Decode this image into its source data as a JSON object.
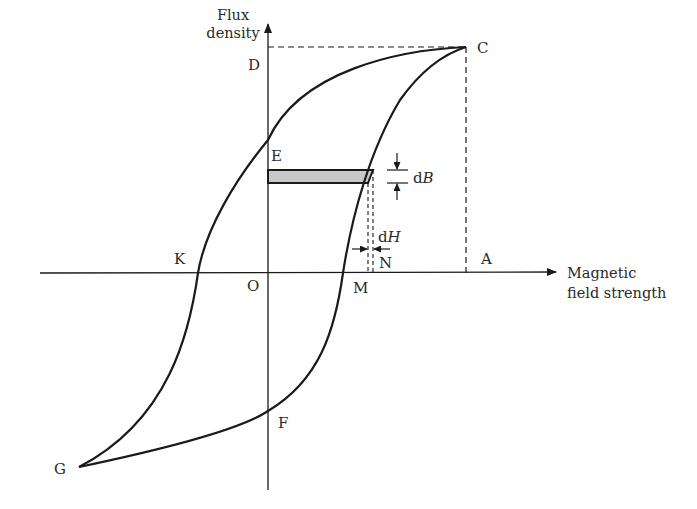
{
  "diagram": {
    "y_axis_title": [
      "Flux",
      "density"
    ],
    "x_axis_title": [
      "Magnetic",
      "field strength"
    ],
    "points": {
      "D": "D",
      "C": "C",
      "E": "E",
      "K": "K",
      "O": "O",
      "M": "M",
      "N": "N",
      "A": "A",
      "F": "F",
      "G": "G"
    },
    "increments": {
      "dB_prefix": "d",
      "dB_var": "B",
      "dH_prefix": "d",
      "dH_var": "H"
    },
    "colors": {
      "line": "#1a1a1a",
      "shaded_strip": "#c8c8c8",
      "text": "#2a2a2a"
    }
  }
}
